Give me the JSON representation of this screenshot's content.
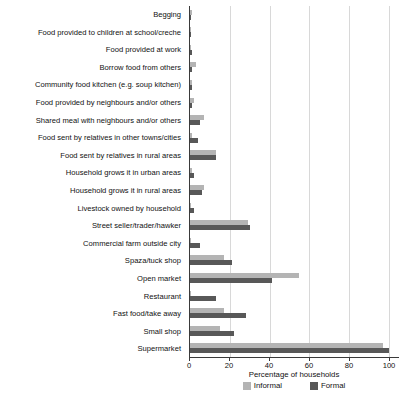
{
  "chart_data": {
    "type": "bar",
    "orientation": "horizontal",
    "title": "",
    "xlabel": "Percentage of households",
    "ylabel": "",
    "xlim": [
      0,
      105
    ],
    "xticks": [
      0,
      20,
      40,
      60,
      80,
      100
    ],
    "grid": true,
    "legend_position": "bottom-center",
    "categories": [
      "Begging",
      "Food provided to children at school/creche",
      "Food provided at work",
      "Borrow food from others",
      "Community food kitchen (e.g. soup kitchen)",
      "Food provided by neighbours and/or others",
      "Shared meal with neighbours and/or others",
      "Food sent by relatives in other towns/cities",
      "Food sent by relatives in rural areas",
      "Household grows it in urban areas",
      "Household grows it in rural areas",
      "Livestock owned by household",
      "Street seller/trader/hawker",
      "Commercial farm outside city",
      "Spaza/tuck shop",
      "Open market",
      "Restaurant",
      "Fast food/take away",
      "Small shop",
      "Supermarket"
    ],
    "series": [
      {
        "name": "Informal",
        "color": "#b4b4b4",
        "values": [
          1,
          0.5,
          0.5,
          3,
          1,
          2,
          7,
          1,
          13,
          1,
          7,
          0.5,
          29,
          0.5,
          17,
          55,
          0.5,
          17,
          15,
          97
        ]
      },
      {
        "name": "Formal",
        "color": "#585858",
        "values": [
          0.5,
          0.5,
          1,
          1,
          1,
          1,
          5,
          4,
          13,
          2,
          6,
          2,
          30,
          5,
          21,
          41,
          13,
          28,
          22,
          100
        ]
      }
    ]
  },
  "legend": {
    "items": [
      {
        "label": "Informal",
        "color": "#b4b4b4"
      },
      {
        "label": "Formal",
        "color": "#585858"
      }
    ]
  },
  "axis": {
    "x_title": "Percentage of households",
    "tick_labels": [
      "0",
      "20",
      "40",
      "60",
      "80",
      "100"
    ]
  }
}
